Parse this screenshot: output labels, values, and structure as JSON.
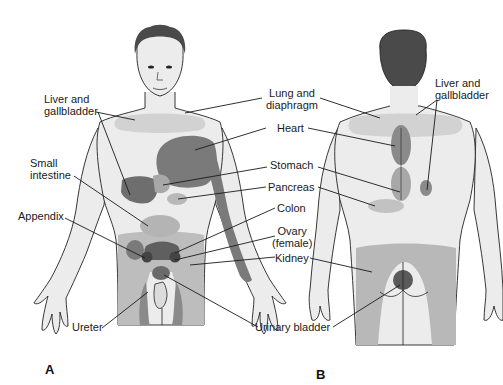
{
  "figure": {
    "panels": [
      {
        "id": "A",
        "label": "A",
        "view": "anterior"
      },
      {
        "id": "B",
        "label": "B",
        "view": "posterior"
      }
    ],
    "colors": {
      "skin": "#ececec",
      "light_zone": "#d2d2d2",
      "mid_zone": "#a9a9a9",
      "dark_zone": "#707070",
      "darkest_zone": "#555555",
      "hair": "#4a4a4a",
      "outline": "#222222",
      "leader": "#1a1a1a"
    }
  },
  "labels": {
    "liver_front_1": "Liver and",
    "liver_front_2": "gallbladder",
    "small_int_1": "Small",
    "small_int_2": "intestine",
    "appendix": "Appendix",
    "ureter": "Ureter",
    "lung_1": "Lung and",
    "lung_2": "diaphragm",
    "heart": "Heart",
    "stomach": "Stomach",
    "pancreas": "Pancreas",
    "colon": "Colon",
    "ovary_1": "Ovary",
    "ovary_2": "(female)",
    "kidney": "Kidney",
    "urinary_bladder": "Urinary bladder",
    "liver_back_1": "Liver and",
    "liver_back_2": "gallbladder"
  }
}
